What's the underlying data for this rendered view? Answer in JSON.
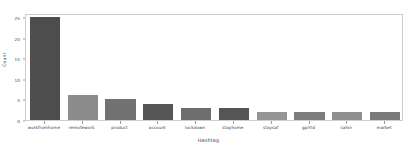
{
  "chart_data": {
    "type": "bar",
    "title": "",
    "xlabel": "Hashtag",
    "ylabel": "Count",
    "categories": [
      "workfromhome",
      "remotework",
      "product",
      "account",
      "lockdown",
      "stayhome",
      "staysaf",
      "gprltd",
      "sahin",
      "market"
    ],
    "values": [
      25,
      6,
      5,
      4,
      3,
      3,
      2,
      2,
      2,
      2
    ],
    "ylim": [
      0,
      26
    ],
    "yticks": [
      0,
      5,
      10,
      15,
      20,
      25
    ],
    "ytick_labels": [
      "0",
      "5",
      "10",
      "15",
      "20",
      "25"
    ],
    "grid": false,
    "legend": null,
    "bar_colors": [
      "#4d4d4d",
      "#8c8c8c",
      "#727272",
      "#555555",
      "#6e6e6e",
      "#555555",
      "#959595",
      "#7d7d7d",
      "#8f8f8f",
      "#7a7a7a"
    ]
  },
  "style": {
    "background": "#ffffff",
    "axis_color": "#cfcfcf",
    "tick_color": "#9a9a9a",
    "text_color": "#3d3d3d"
  }
}
